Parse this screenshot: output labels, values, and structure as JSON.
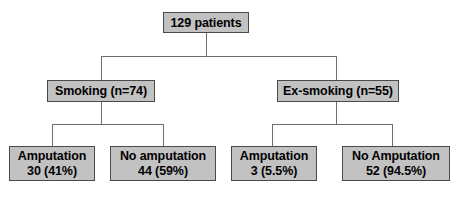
{
  "diagram": {
    "type": "flowchart-tree",
    "title_text": "129 patients",
    "root": {
      "label": "129 patients",
      "n": 129
    },
    "branches": [
      {
        "label": "Smoking (n=74)",
        "group": "Smoking",
        "n": 74,
        "children": [
          {
            "label": "Amputation",
            "value": "30 (41%)",
            "count": 30,
            "percent": "41%"
          },
          {
            "label": "No amputation",
            "value": "44 (59%)",
            "count": 44,
            "percent": "59%"
          }
        ]
      },
      {
        "label": "Ex-smoking (n=55)",
        "group": "Ex-smoking",
        "n": 55,
        "children": [
          {
            "label": "Amputation",
            "value": "3 (5.5%)",
            "count": 3,
            "percent": "5.5%"
          },
          {
            "label": "No Amputation",
            "value": "52 (94.5%)",
            "count": 52,
            "percent": "94.5%"
          }
        ]
      }
    ]
  },
  "colors": {
    "box_fill": "#c2c2c2",
    "box_border": "#4a4a4a",
    "shadow": "#000000",
    "connector": "#6e6e6e",
    "text": "#000000",
    "background": "#ffffff"
  }
}
